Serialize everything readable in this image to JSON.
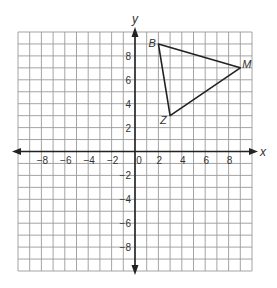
{
  "diagram": {
    "type": "coordinate-plane",
    "axes": {
      "x_label": "x",
      "y_label": "y",
      "x_range": [
        -10,
        10
      ],
      "y_range": [
        -10,
        10
      ],
      "tick_step": 2,
      "x_tick_labels": [
        "-8",
        "-6",
        "-4",
        "-2",
        "0",
        "2",
        "4",
        "6",
        "8"
      ],
      "y_tick_labels": [
        "8",
        "6",
        "4",
        "2",
        "-2",
        "-4",
        "-6",
        "-8"
      ]
    },
    "triangle": {
      "vertices": [
        {
          "name": "B",
          "x": 2,
          "y": 9
        },
        {
          "name": "M",
          "x": 9,
          "y": 7
        },
        {
          "name": "Z",
          "x": 3,
          "y": 3
        }
      ]
    },
    "colors": {
      "grid": "#9a9a9a",
      "axes": "#222222",
      "triangle": "#222222",
      "text": "#333333"
    }
  }
}
